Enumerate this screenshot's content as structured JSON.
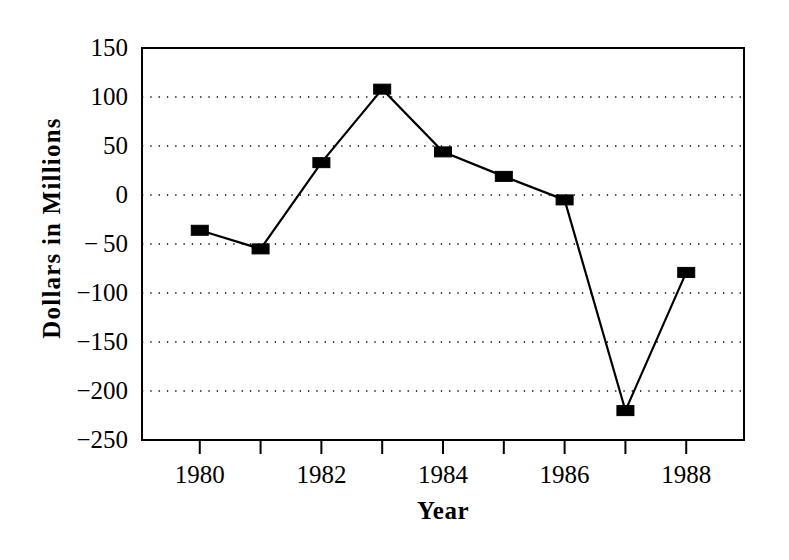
{
  "chart_data": {
    "type": "line",
    "title": "",
    "xlabel": "Year",
    "ylabel": "Dollars in Millions",
    "x": [
      1980,
      1981,
      1982,
      1983,
      1984,
      1985,
      1986,
      1987,
      1988
    ],
    "values": [
      -36,
      -55,
      33,
      108,
      44,
      19,
      -5,
      -220,
      -79
    ],
    "series": [
      {
        "name": "",
        "values": [
          -36,
          -55,
          33,
          108,
          44,
          19,
          -5,
          -220,
          -79
        ]
      }
    ],
    "xlim": [
      1979.05,
      1988.95
    ],
    "ylim": [
      -250,
      150
    ],
    "yticks": [
      150,
      100,
      50,
      0,
      -50,
      -100,
      -150,
      -200,
      -250
    ],
    "ytick_labels": [
      "150",
      "100",
      "50",
      "0",
      "− 50",
      "−100",
      "−150",
      "−200",
      "−250"
    ],
    "xticks": [
      1980,
      1981,
      1982,
      1983,
      1984,
      1985,
      1986,
      1987,
      1988
    ],
    "xtick_labels": [
      "1980",
      "",
      "1982",
      "",
      "1984",
      "",
      "1986",
      "",
      "1988"
    ],
    "grid": "horizontal-dotted",
    "legend": "none",
    "marker": "filled-rectangle",
    "line_color": "#000000",
    "marker_color": "#000000",
    "grid_color": "#000000",
    "background_color": "#ffffff"
  }
}
